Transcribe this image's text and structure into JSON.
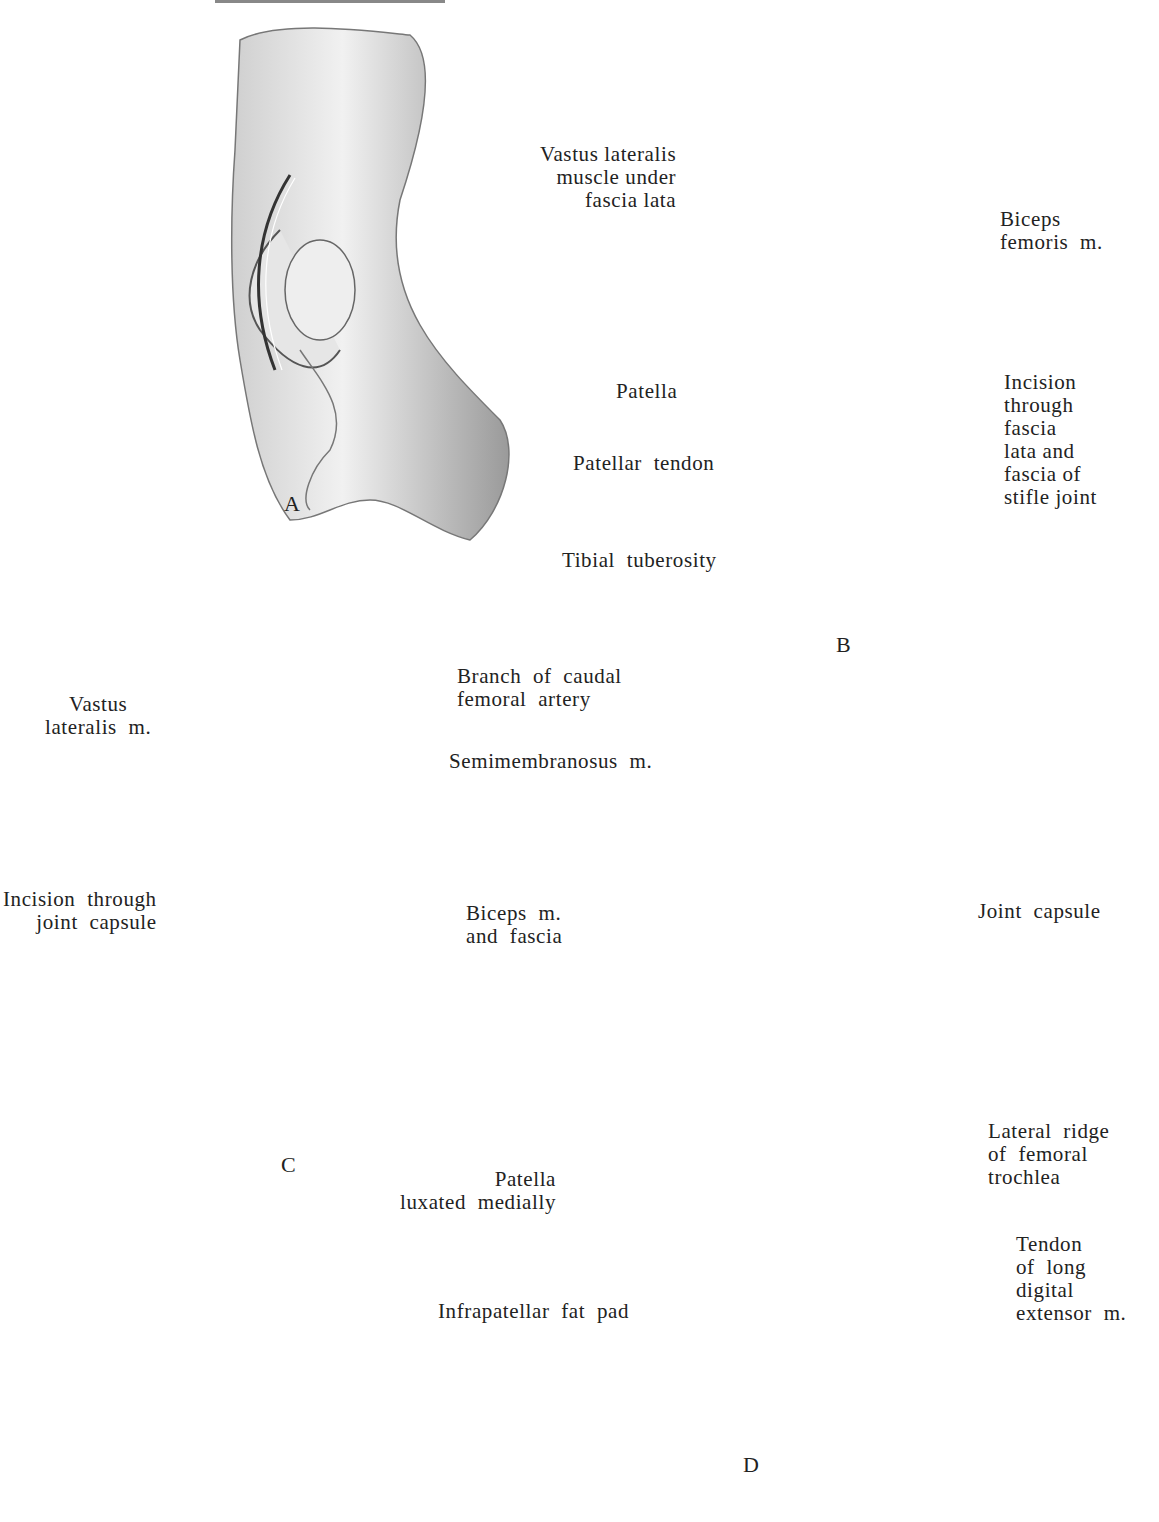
{
  "figure": {
    "panels": [
      {
        "id": "A",
        "letter": "A",
        "labels": []
      },
      {
        "id": "B",
        "letter": "B",
        "labels": [
          "Vastus lateralis\nmuscle under\nfascia lata",
          "Biceps\nfemoris  m.",
          "Patella",
          "Incision\nthrough\nfascia\nlata and\nfascia of\nstifle joint",
          "Patellar  tendon",
          "Tibial  tuberosity"
        ]
      },
      {
        "id": "C",
        "letter": "C",
        "labels": [
          "Branch  of  caudal\nfemoral  artery",
          "Vastus\nlateralis  m.",
          "Semimembranosus  m.",
          "Incision  through\njoint  capsule",
          "Biceps  m.\nand  fascia"
        ]
      },
      {
        "id": "D",
        "letter": "D",
        "labels": [
          "Joint  capsule",
          "Lateral  ridge\nof  femoral\ntrochlea",
          "Patella\nluxated  medially",
          "Tendon\nof  long\ndigital\nextensor  m.",
          "Infrapatellar  fat  pad"
        ]
      }
    ]
  }
}
